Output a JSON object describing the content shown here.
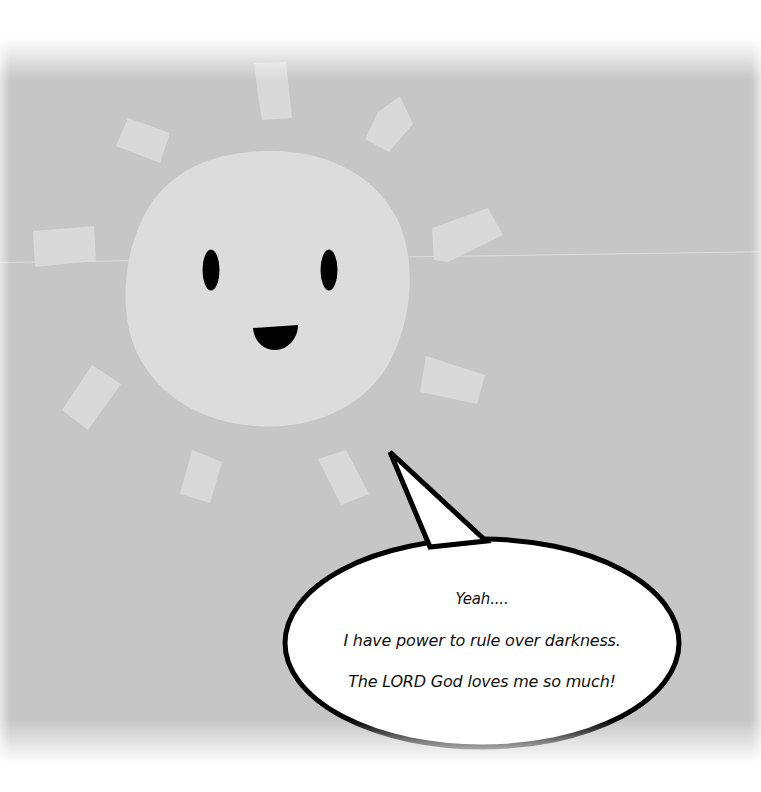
{
  "scene": {
    "description": "Cartoon smiling paper-cut sun with a speech bubble",
    "colors": {
      "background": "#c6c6c6",
      "sun": "#dcdcdc",
      "rays": "#d9d9d9",
      "face": "#000000",
      "bubble_fill": "#ffffff",
      "bubble_outline": "#000000"
    }
  },
  "speech_bubble": {
    "lines": [
      "Yeah....",
      "I have power to rule over darkness.",
      "The LORD God loves me so much!"
    ]
  }
}
